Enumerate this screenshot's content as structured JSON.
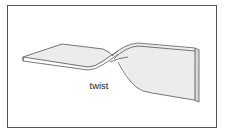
{
  "diagram": {
    "label": "twist",
    "colors": {
      "stroke": "#555555",
      "fill": "#ececec",
      "edge": "#d8d8d8",
      "frame": "#555555"
    }
  }
}
